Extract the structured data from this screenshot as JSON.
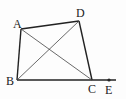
{
  "diagram": {
    "type": "quadrilateral-with-diagonals",
    "points": {
      "A": {
        "label": "A",
        "x": 21,
        "y": 29,
        "lx": 13,
        "ly": 28
      },
      "B": {
        "label": "B",
        "x": 17,
        "y": 80,
        "lx": 6,
        "ly": 85
      },
      "C": {
        "label": "C",
        "x": 92,
        "y": 80,
        "lx": 88,
        "ly": 93
      },
      "D": {
        "label": "D",
        "x": 79,
        "y": 21,
        "lx": 76,
        "ly": 17
      },
      "E": {
        "label": "E",
        "x": 109,
        "y": 80,
        "lx": 105,
        "ly": 94
      }
    },
    "segments": [
      {
        "from": "A",
        "to": "D",
        "weight": "bold"
      },
      {
        "from": "D",
        "to": "C",
        "weight": "bold"
      },
      {
        "from": "A",
        "to": "B",
        "weight": "bold"
      },
      {
        "from": "B",
        "to": "C",
        "weight": "bold"
      },
      {
        "from": "A",
        "to": "C",
        "weight": "thin"
      },
      {
        "from": "B",
        "to": "D",
        "weight": "thin"
      },
      {
        "from": "C",
        "to": "E",
        "weight": "bold",
        "extends_to_x": 116
      }
    ],
    "line_color": "#222222"
  }
}
